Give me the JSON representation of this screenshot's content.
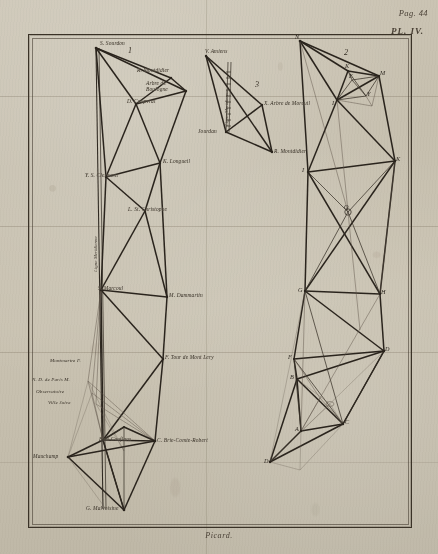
{
  "page": {
    "page_number": "Pag. 44",
    "plate_number": "PL. IV.",
    "signature": "Picard."
  },
  "figures": [
    {
      "id": "fig1",
      "number": "1"
    },
    {
      "id": "fig2",
      "number": "2"
    },
    {
      "id": "fig3",
      "number": "3"
    }
  ],
  "figure1": {
    "number": "1",
    "meridian_label": "Ligne Meridienne",
    "stations": [
      {
        "key": "sourdon",
        "letter": "S",
        "name": "S. Sourdon"
      },
      {
        "key": "montdidier",
        "letter": "R",
        "name": "R. Montdidier"
      },
      {
        "key": "boulogne",
        "letter": "",
        "name": "Arbre de Boulogne"
      },
      {
        "key": "coupvrai",
        "letter": "D",
        "name": "D. Coupvrai"
      },
      {
        "key": "longueil",
        "letter": "K",
        "name": "K. Longueil"
      },
      {
        "key": "clermont",
        "letter": "Y",
        "name": "Y. S. Clermont"
      },
      {
        "key": "stchristophe",
        "letter": "L",
        "name": "L. St. Christophe"
      },
      {
        "key": "marcoul",
        "letter": "S",
        "name": "S. Marcoul"
      },
      {
        "key": "dammartin",
        "letter": "M",
        "name": "M. Dammartin"
      },
      {
        "key": "montlery",
        "letter": "F",
        "name": "F. Tour de Mont Lery"
      },
      {
        "key": "montmartre",
        "letter": "F",
        "name": "Montmartre F."
      },
      {
        "key": "notredame",
        "letter": "M",
        "name": "N. D. de Paris M."
      },
      {
        "key": "observatoire",
        "letter": "",
        "name": "Observatoire"
      },
      {
        "key": "villejuive",
        "letter": "",
        "name": "Ville Juive"
      },
      {
        "key": "boisconflans",
        "letter": "D",
        "name": "Bois Conflans"
      },
      {
        "key": "brie",
        "letter": "C",
        "name": "C. Brie-Comte-Robert"
      },
      {
        "key": "mauchamp",
        "letter": "D",
        "name": "Mauchamp"
      },
      {
        "key": "malvoisine",
        "letter": "G",
        "name": "G. Malvoisine"
      }
    ]
  },
  "figure3": {
    "number": "3",
    "meridian_label": "Ligne Meridienne",
    "stations": [
      {
        "key": "amiens",
        "letter": "V",
        "name": "V. Amiens"
      },
      {
        "key": "moreuil",
        "letter": "X",
        "name": "X. Arbre de Moreuil"
      },
      {
        "key": "jourdan",
        "letter": "",
        "name": "Jourdan"
      },
      {
        "key": "montdidier2",
        "letter": "R",
        "name": "R. Montdidier"
      }
    ]
  },
  "figure2": {
    "number": "2",
    "vertices": [
      {
        "letter": "N",
        "x": 300,
        "y": 41
      },
      {
        "letter": "K",
        "x": 348,
        "y": 71
      },
      {
        "letter": "M",
        "x": 379,
        "y": 76
      },
      {
        "letter": "E",
        "x": 352,
        "y": 80
      },
      {
        "letter": "Y",
        "x": 366,
        "y": 96
      },
      {
        "letter": "I",
        "x": 337,
        "y": 100
      },
      {
        "letter": "K",
        "x": 395,
        "y": 161
      },
      {
        "letter": "I",
        "x": 308,
        "y": 172
      },
      {
        "letter": "Q",
        "x": 348,
        "y": 212
      },
      {
        "letter": "G",
        "x": 305,
        "y": 291
      },
      {
        "letter": "H",
        "x": 380,
        "y": 294
      },
      {
        "letter": "D",
        "x": 384,
        "y": 351
      },
      {
        "letter": "F",
        "x": 294,
        "y": 359
      },
      {
        "letter": "B",
        "x": 297,
        "y": 379
      },
      {
        "letter": "C",
        "x": 343,
        "y": 424
      },
      {
        "letter": "A",
        "x": 301,
        "y": 431
      },
      {
        "letter": "D",
        "x": 270,
        "y": 462
      }
    ]
  },
  "colors": {
    "ink": "#2d2720",
    "paper": "#c9c2b1",
    "frame": "#3a3227",
    "faint_ink": "#6a6053"
  }
}
